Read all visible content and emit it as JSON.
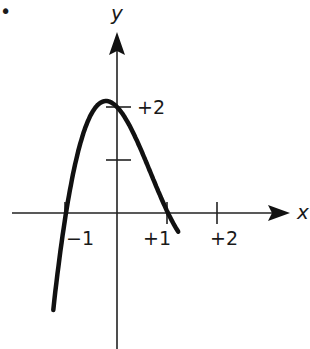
{
  "figure": {
    "bullet": "•",
    "x_axis_label": "x",
    "y_axis_label": "y",
    "x_ticks": [
      {
        "value": -1,
        "label": "−1"
      },
      {
        "value": 1,
        "label": "+1"
      },
      {
        "value": 2,
        "label": "+2"
      }
    ],
    "y_ticks": [
      {
        "value": 1,
        "label": ""
      },
      {
        "value": 2,
        "label": "+2"
      }
    ],
    "curve": {
      "description": "cubic polynomial with roots at x=-1, x=+1, x=+2 and y-intercept +2",
      "function": "y = (x+1)(x-1)(x-2)",
      "color": "#111111"
    }
  }
}
